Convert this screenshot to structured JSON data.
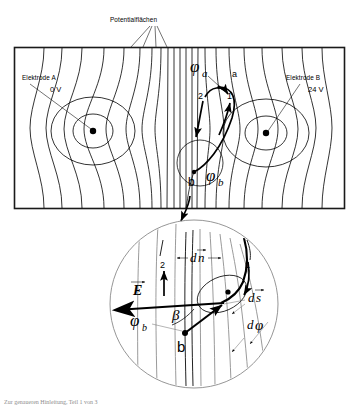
{
  "figure": {
    "title_label": "Potentialflächen",
    "main_box": {
      "electrode_a": {
        "name": "Elektrode A",
        "voltage": "0 V"
      },
      "electrode_b": {
        "name": "Elektrode B",
        "voltage": "24 V"
      },
      "potential_a_symbol": "φ",
      "potential_a_sub": "a",
      "potential_b_symbol": "φ",
      "potential_b_sub": "b",
      "point_a": "a",
      "point_b": "b",
      "path_marker_1": "1",
      "path_marker_2": "2"
    },
    "detail_circle": {
      "field_vector": "E",
      "potential_b_symbol": "φ",
      "potential_b_sub": "b",
      "point_b": "b",
      "angle_beta": "β",
      "normal_element": "dn̄",
      "normal_element_d": "d",
      "normal_element_n": "n",
      "path_element_d": "d",
      "path_element_s": "s",
      "potential_diff_d": "d",
      "potential_diff_phi": "φ",
      "path_marker_1": "1",
      "path_marker_2": "2"
    },
    "caption": "Zur genaueren Hinleitung, Teil 1 von 3",
    "colors": {
      "ink": "#000000",
      "frame": "#1a1a1a",
      "detail_line": "#8a8a8a",
      "caption": "#8d8d8d",
      "background": "#ffffff"
    }
  }
}
